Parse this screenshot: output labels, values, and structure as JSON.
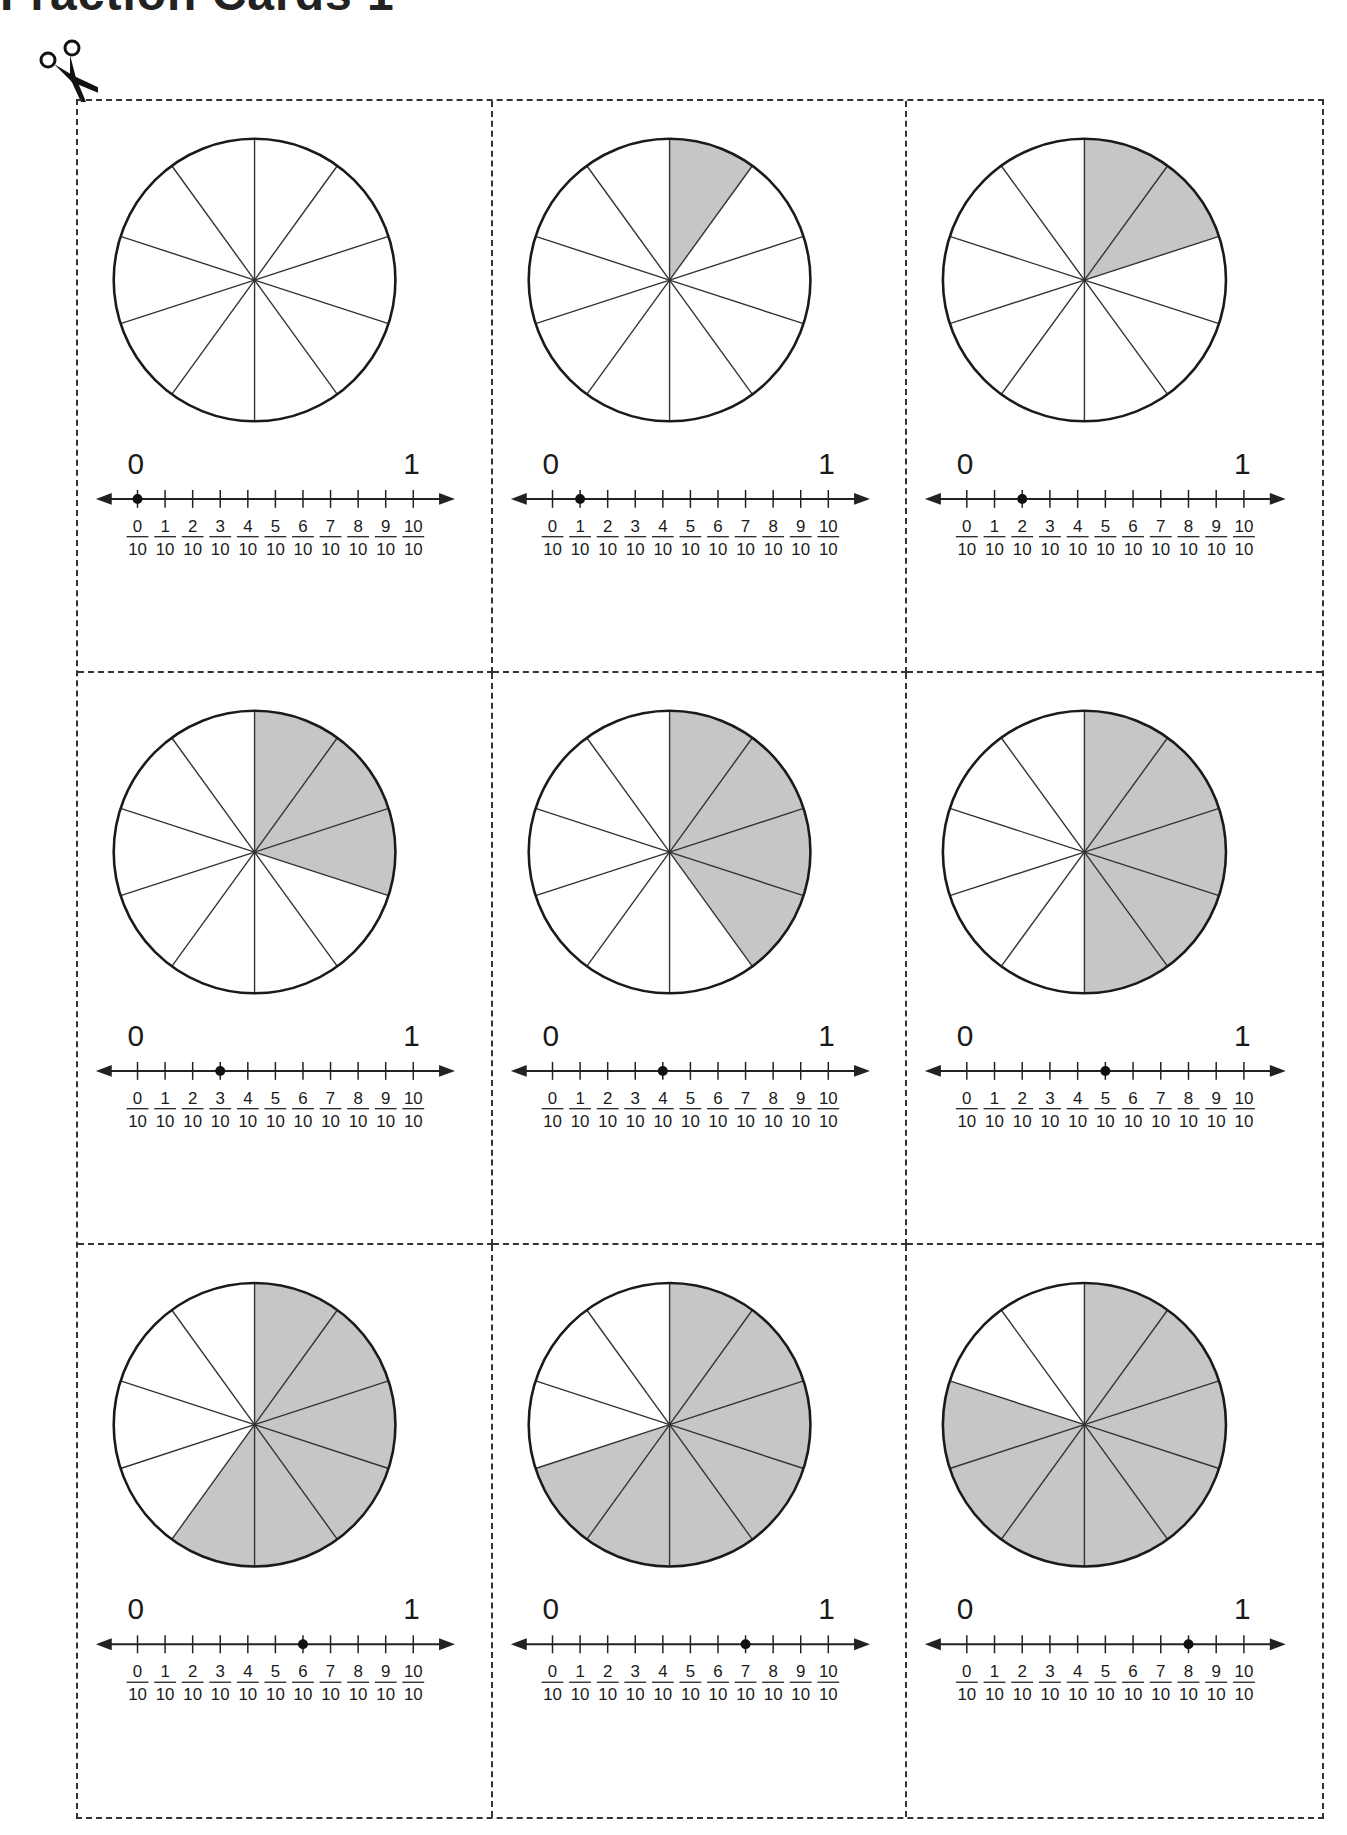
{
  "page": {
    "title": "Fraction Cards 1",
    "cut_icon": "scissors-icon"
  },
  "style": {
    "shade_color": "#c6c6c6",
    "line_color": "#1a1a1a",
    "border_color": "#333333"
  },
  "number_line": {
    "start_label": "0",
    "end_label": "1",
    "denominator": "10",
    "numerators": [
      "0",
      "1",
      "2",
      "3",
      "4",
      "5",
      "6",
      "7",
      "8",
      "9",
      "10"
    ]
  },
  "cards": [
    {
      "id": 1,
      "shaded_parts": 0,
      "total_parts": 10,
      "dot_at": 0,
      "fraction": "0/10"
    },
    {
      "id": 2,
      "shaded_parts": 1,
      "total_parts": 10,
      "dot_at": 1,
      "fraction": "1/10"
    },
    {
      "id": 3,
      "shaded_parts": 2,
      "total_parts": 10,
      "dot_at": 2,
      "fraction": "2/10"
    },
    {
      "id": 4,
      "shaded_parts": 3,
      "total_parts": 10,
      "dot_at": 3,
      "fraction": "3/10"
    },
    {
      "id": 5,
      "shaded_parts": 4,
      "total_parts": 10,
      "dot_at": 4,
      "fraction": "4/10"
    },
    {
      "id": 6,
      "shaded_parts": 5,
      "total_parts": 10,
      "dot_at": 5,
      "fraction": "5/10"
    },
    {
      "id": 7,
      "shaded_parts": 6,
      "total_parts": 10,
      "dot_at": 6,
      "fraction": "6/10"
    },
    {
      "id": 8,
      "shaded_parts": 7,
      "total_parts": 10,
      "dot_at": 7,
      "fraction": "7/10"
    },
    {
      "id": 9,
      "shaded_parts": 8,
      "total_parts": 10,
      "dot_at": 8,
      "fraction": "8/10"
    }
  ]
}
